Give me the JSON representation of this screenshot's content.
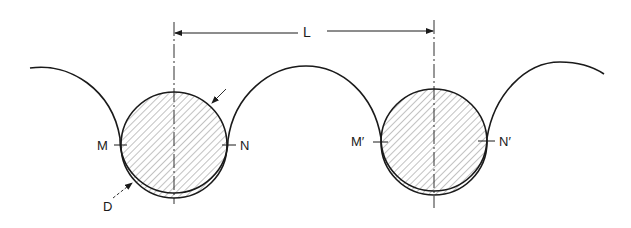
{
  "diagram": {
    "type": "engineering-cross-section",
    "colors": {
      "line": "#1a1a1a",
      "hatch": "#555555",
      "background": "#ffffff"
    },
    "dimension": {
      "label": "L",
      "from_x": 174,
      "to_x": 434,
      "y": 32
    },
    "circles": [
      {
        "id": "left",
        "cx": 174,
        "cy": 145,
        "r": 53,
        "left_point_label": "M",
        "right_point_label": "N",
        "diameter_label": "D"
      },
      {
        "id": "right",
        "cx": 434,
        "cy": 142,
        "r": 53,
        "left_point_label": "M′",
        "right_point_label": "N′"
      }
    ],
    "labels": {
      "L": "L",
      "M": "M",
      "N": "N",
      "M_prime": "M′",
      "N_prime": "N′",
      "D": "D"
    }
  }
}
